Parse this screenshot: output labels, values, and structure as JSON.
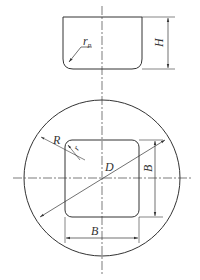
{
  "diagram": {
    "colors": {
      "line": "#333333",
      "background": "#ffffff"
    },
    "top_view": {
      "labels": {
        "corner_radius": "r",
        "corner_radius_sub": "p",
        "height": "H"
      }
    },
    "plan_view": {
      "labels": {
        "outer_radius": "R",
        "inner_corner": "r",
        "diameter": "D",
        "side_vertical": "B",
        "side_horizontal": "B"
      }
    }
  }
}
